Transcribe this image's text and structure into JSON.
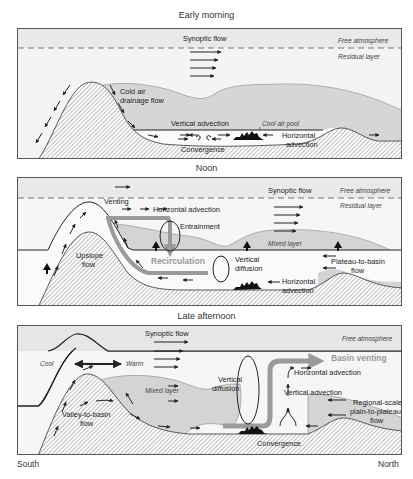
{
  "panels": [
    {
      "title": "Early morning",
      "labels": {
        "synoptic_flow": "Synoptic flow",
        "free_atmosphere": "Free atmosphere",
        "residual_layer": "Residual layer",
        "cold_air_1": "Cold air",
        "cold_air_2": "drainage flow",
        "vertical_advection": "Vertical advection",
        "cool_air_pool": "Cool air pool",
        "horizontal_advection_1": "Horizontal",
        "horizontal_advection_2": "advection",
        "convergence": "Convergence"
      }
    },
    {
      "title": "Noon",
      "labels": {
        "synoptic_flow": "Synoptic flow",
        "free_atmosphere": "Free atmosphere",
        "residual_layer": "Residual layer",
        "venting": "Venting",
        "horizontal_advection_top": "Horizontal advection",
        "entrainment": "Entrainment",
        "mixed_layer": "Mixed layer",
        "upslope_1": "Upslope",
        "upslope_2": "flow",
        "recirculation": "Recirculation",
        "vertical_diffusion_1": "Vertical",
        "vertical_diffusion_2": "diffusion",
        "plateau_1": "Plateau-to-basin",
        "plateau_2": "flow",
        "horizontal_advection_1": "Horizontal",
        "horizontal_advection_2": "advection"
      }
    },
    {
      "title": "Late afternoon",
      "labels": {
        "synoptic_flow": "Synoptic flow",
        "free_atmosphere": "Free atmosphere",
        "cool": "Cool",
        "warm": "Warm",
        "mixed_layer": "Mixed layer",
        "vertical_diffusion_1": "Vertical",
        "vertical_diffusion_2": "diffusion",
        "basin_venting": "Basin venting",
        "horizontal_advection": "Horizontal advection",
        "vertical_advection": "Vertical advection",
        "regional_1": "Regional-scale",
        "regional_2": "plain-to-plateau",
        "regional_3": "flow",
        "valley_1": "Valley-to-basin",
        "valley_2": "flow",
        "convergence": "Convergence"
      }
    }
  ],
  "axis": {
    "left": "South",
    "right": "North"
  },
  "colors": {
    "terrain_hatch": "#8a8a8a",
    "stable_layer": "#d4d4d4",
    "upper_air": "#ececec",
    "arrow": "#222222",
    "venting_arrow": "#9a9a9a",
    "border": "#555555"
  }
}
